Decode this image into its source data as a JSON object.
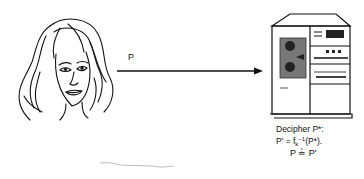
{
  "diagram": {
    "sender": {
      "icon": "woman-face-icon"
    },
    "channel": {
      "label": "P",
      "arrow_color": "#111111"
    },
    "receiver": {
      "icon": "computer-mainframe-icon",
      "caption_line1": "Decipher P*:",
      "caption_line2_prefix": "P' = f",
      "caption_line2_sub": "k",
      "caption_line2_sup": "−1",
      "caption_line2_suffix": "(P*).",
      "comparison": "P ≟ P'"
    }
  }
}
